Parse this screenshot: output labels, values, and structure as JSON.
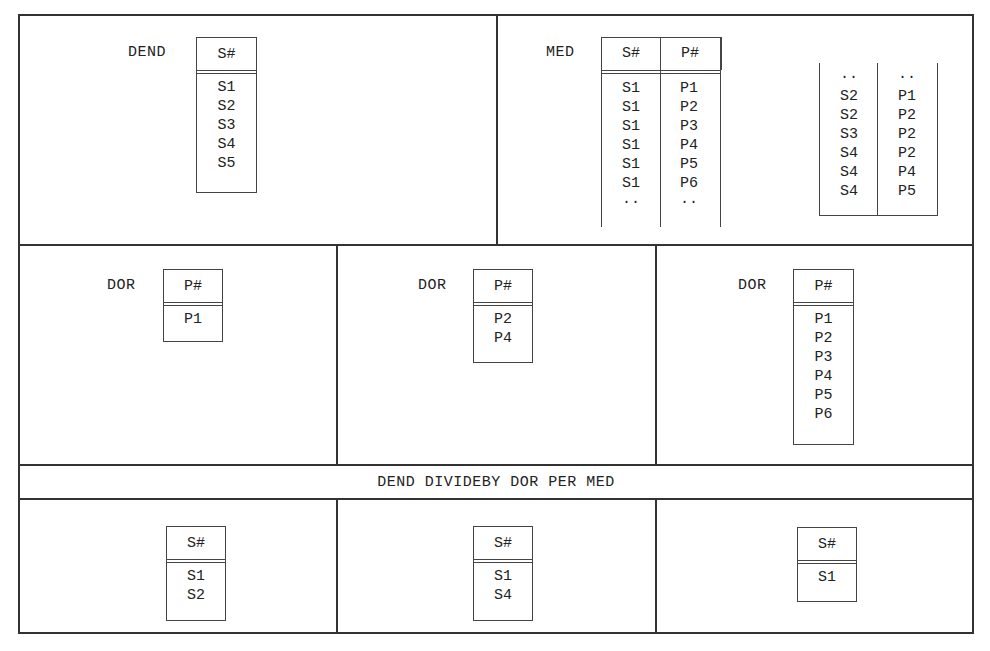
{
  "figure": {
    "dend": {
      "name": "DEND",
      "header": "S#",
      "rows": [
        "S1",
        "S2",
        "S3",
        "S4",
        "S5"
      ]
    },
    "med": {
      "name": "MED",
      "headers": [
        "S#",
        "P#"
      ],
      "part1": [
        [
          "S1",
          "P1"
        ],
        [
          "S1",
          "P2"
        ],
        [
          "S1",
          "P3"
        ],
        [
          "S1",
          "P4"
        ],
        [
          "S1",
          "P5"
        ],
        [
          "S1",
          "P6"
        ],
        [
          "··",
          "··"
        ]
      ],
      "part2": [
        [
          "··",
          "··"
        ],
        [
          "S2",
          "P1"
        ],
        [
          "S2",
          "P2"
        ],
        [
          "S3",
          "P2"
        ],
        [
          "S4",
          "P2"
        ],
        [
          "S4",
          "P4"
        ],
        [
          "S4",
          "P5"
        ]
      ]
    },
    "dors": [
      {
        "name": "DOR",
        "header": "P#",
        "rows": [
          "P1"
        ]
      },
      {
        "name": "DOR",
        "header": "P#",
        "rows": [
          "P2",
          "P4"
        ]
      },
      {
        "name": "DOR",
        "header": "P#",
        "rows": [
          "P1",
          "P2",
          "P3",
          "P4",
          "P5",
          "P6"
        ]
      }
    ],
    "expression": "DEND DIVIDEBY DOR PER MED",
    "results": [
      {
        "header": "S#",
        "rows": [
          "S1",
          "S2"
        ]
      },
      {
        "header": "S#",
        "rows": [
          "S1",
          "S4"
        ]
      },
      {
        "header": "S#",
        "rows": [
          "S1"
        ]
      }
    ]
  }
}
